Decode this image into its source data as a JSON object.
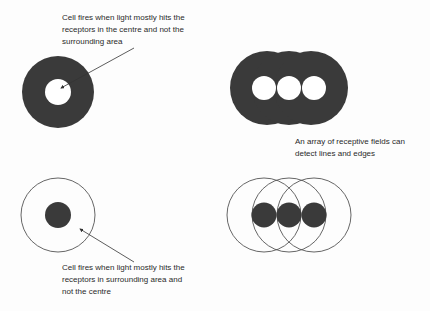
{
  "colors": {
    "fill": "#3a3a3a",
    "stroke": "#555555",
    "background": "#fdfdfd",
    "text": "#2a2a2a"
  },
  "captions": {
    "on_center": "Cell fires when light mostly hits the\nreceptors in the centre and not the\nsurrounding area",
    "array": "An array of receptive fields can\ndetect lines and edges",
    "off_center": "Cell fires when light mostly hits the\nreceptors in surrounding area and\nnot the centre"
  },
  "figures": [
    {
      "id": "on-center-field",
      "type": "filled ring with white centre"
    },
    {
      "id": "on-center-array",
      "type": "three overlapping filled rings with white centres"
    },
    {
      "id": "off-center-field",
      "type": "outline ring with filled centre"
    },
    {
      "id": "off-center-array",
      "type": "three overlapping outline rings with filled centres"
    }
  ]
}
